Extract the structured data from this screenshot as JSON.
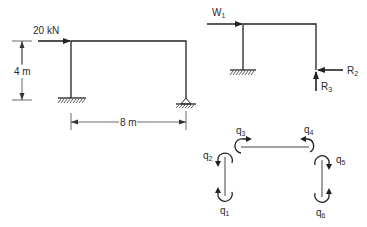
{
  "frame_a": {
    "load_label": "20 kN",
    "height_label": "4 m",
    "span_label": "8 m",
    "supports": [
      "fixed",
      "pinned"
    ]
  },
  "frame_b": {
    "load_label": "W",
    "load_sub": "1",
    "reactions": [
      {
        "label": "R",
        "sub": "2",
        "direction": "horizontal"
      },
      {
        "label": "R",
        "sub": "3",
        "direction": "vertical"
      }
    ],
    "supports": [
      "fixed"
    ]
  },
  "dof_diagram": {
    "coords": [
      {
        "label": "q",
        "sub": "1"
      },
      {
        "label": "q",
        "sub": "2"
      },
      {
        "label": "q",
        "sub": "3"
      },
      {
        "label": "q",
        "sub": "4"
      },
      {
        "label": "q",
        "sub": "5"
      },
      {
        "label": "q",
        "sub": "6"
      }
    ]
  },
  "colors": {
    "line": "#222222",
    "text": "#2a2a2a",
    "background": "#ffffff"
  }
}
